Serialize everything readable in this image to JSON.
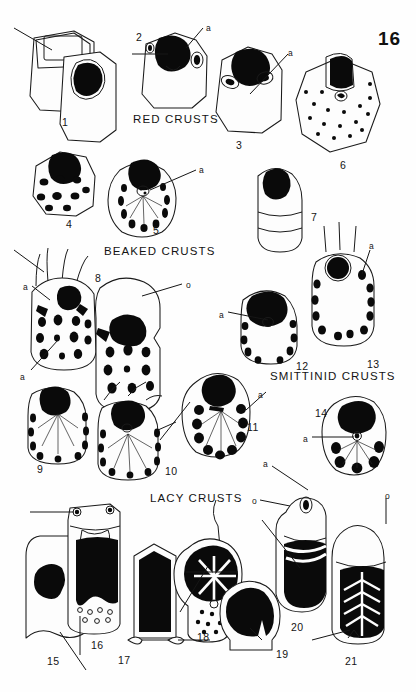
{
  "plate": {
    "number": "16",
    "background_color": "#fefefe",
    "ink_color": "#111111"
  },
  "groups": [
    {
      "id": "red",
      "label": "RED CRUSTS",
      "x": 133,
      "y": 113
    },
    {
      "id": "beaked",
      "label": "BEAKED CRUSTS",
      "x": 104,
      "y": 245
    },
    {
      "id": "smittinid",
      "label": "SMITTINID CRUSTS",
      "x": 270,
      "y": 370
    },
    {
      "id": "lacy",
      "label": "LACY CRUSTS",
      "x": 150,
      "y": 492
    }
  ],
  "figures": [
    {
      "num": "1",
      "nx": 62,
      "ny": 116,
      "group": "red"
    },
    {
      "num": "2",
      "nx": 136,
      "ny": 31,
      "group": "red"
    },
    {
      "num": "3",
      "nx": 236,
      "ny": 139,
      "group": "red"
    },
    {
      "num": "4",
      "nx": 66,
      "ny": 218,
      "group": "red"
    },
    {
      "num": "5",
      "nx": 153,
      "ny": 224,
      "group": "red"
    },
    {
      "num": "6",
      "nx": 340,
      "ny": 159,
      "group": "red"
    },
    {
      "num": "7",
      "nx": 311,
      "ny": 211,
      "group": "red"
    },
    {
      "num": "8",
      "nx": 95,
      "ny": 272,
      "group": "beaked"
    },
    {
      "num": "9",
      "nx": 37,
      "ny": 463,
      "group": "beaked"
    },
    {
      "num": "10",
      "nx": 165,
      "ny": 465,
      "group": "beaked"
    },
    {
      "num": "11",
      "nx": 247,
      "ny": 421,
      "group": "beaked"
    },
    {
      "num": "12",
      "nx": 296,
      "ny": 360,
      "group": "smittinid"
    },
    {
      "num": "13",
      "nx": 367,
      "ny": 358,
      "group": "smittinid"
    },
    {
      "num": "14",
      "nx": 315,
      "ny": 407,
      "group": "smittinid"
    },
    {
      "num": "15",
      "nx": 47,
      "ny": 655,
      "group": "lacy"
    },
    {
      "num": "16",
      "nx": 91,
      "ny": 639,
      "group": "lacy"
    },
    {
      "num": "17",
      "nx": 118,
      "ny": 654,
      "group": "lacy"
    },
    {
      "num": "18",
      "nx": 197,
      "ny": 631,
      "group": "lacy"
    },
    {
      "num": "19",
      "nx": 276,
      "ny": 648,
      "group": "lacy"
    },
    {
      "num": "20",
      "nx": 291,
      "ny": 621,
      "group": "lacy"
    },
    {
      "num": "21",
      "nx": 345,
      "ny": 655,
      "group": "lacy"
    }
  ],
  "callouts": [
    {
      "text": "a",
      "x": 206,
      "y": 24,
      "fig": "2"
    },
    {
      "text": "a",
      "x": 288,
      "y": 49,
      "fig": "6"
    },
    {
      "text": "a",
      "x": 199,
      "y": 166,
      "fig": "5"
    },
    {
      "text": "a",
      "x": 23,
      "y": 283,
      "fig": "8"
    },
    {
      "text": "a",
      "x": 20,
      "y": 373,
      "fig": "9"
    },
    {
      "text": "o",
      "x": 186,
      "y": 281,
      "fig": "8"
    },
    {
      "text": "a",
      "x": 219,
      "y": 311,
      "fig": "12"
    },
    {
      "text": "a",
      "x": 369,
      "y": 242,
      "fig": "13"
    },
    {
      "text": "a",
      "x": 258,
      "y": 391,
      "fig": "11"
    },
    {
      "text": "a",
      "x": 303,
      "y": 435,
      "fig": "14"
    },
    {
      "text": "a",
      "x": 263,
      "y": 460,
      "fig": "20"
    },
    {
      "text": "o",
      "x": 252,
      "y": 497,
      "fig": "20"
    },
    {
      "text": "o",
      "x": 385,
      "y": 492,
      "fig": "21"
    }
  ]
}
